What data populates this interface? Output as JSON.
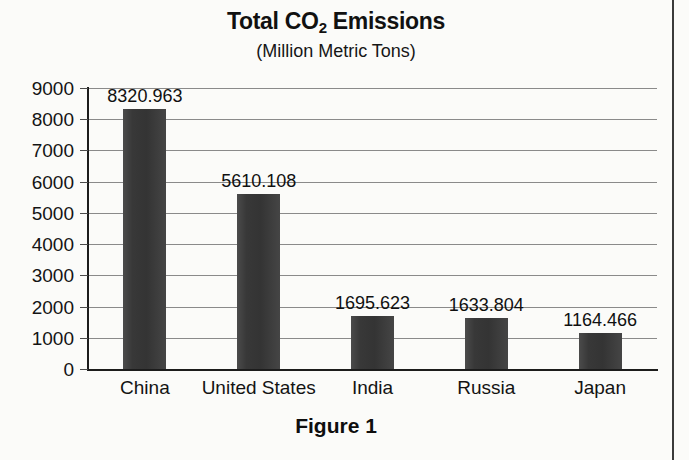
{
  "figure": {
    "caption": "Figure 1"
  },
  "chart_data": {
    "type": "bar",
    "title": "Total CO2 Emissions",
    "title_parts": {
      "before": "Total CO",
      "subscript": "2",
      "after": " Emissions"
    },
    "subtitle": "(Million Metric Tons)",
    "xlabel": "",
    "ylabel": "",
    "categories": [
      "China",
      "United States",
      "India",
      "Russia",
      "Japan"
    ],
    "values": [
      8320.963,
      5610.108,
      1695.623,
      1633.804,
      1164.466
    ],
    "value_labels": [
      "8320.963",
      "5610.108",
      "1695.623",
      "1633.804",
      "1164.466"
    ],
    "ylim": [
      0,
      9000
    ],
    "ytick_labels": [
      "9000",
      "8000",
      "7000",
      "6000",
      "5000",
      "4000",
      "3000",
      "2000",
      "1000",
      "0"
    ],
    "ytick_values": [
      9000,
      8000,
      7000,
      6000,
      5000,
      4000,
      3000,
      2000,
      1000,
      0
    ],
    "grid": true,
    "legend": false,
    "bar_color": "#383838",
    "gridline_color": "#8a8a8a",
    "axis_color": "#1c1c1c",
    "background_color": "#fbfbf9"
  }
}
